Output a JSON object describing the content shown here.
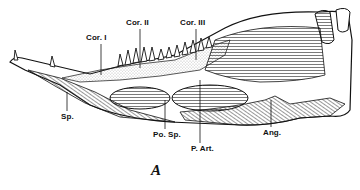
{
  "figure": {
    "caption": "A",
    "labels": [
      {
        "id": "cor1",
        "text": "Cor. I",
        "x": 86,
        "y": 34,
        "leader": [
          [
            101,
            44
          ],
          [
            101,
            75
          ]
        ]
      },
      {
        "id": "cor2",
        "text": "Cor. II",
        "x": 126,
        "y": 19,
        "leader": [
          [
            140,
            29
          ],
          [
            140,
            68
          ]
        ]
      },
      {
        "id": "cor3",
        "text": "Cor. III",
        "x": 180,
        "y": 19,
        "leader": [
          [
            196,
            29
          ],
          [
            196,
            60
          ]
        ]
      },
      {
        "id": "sp",
        "text": "Sp.",
        "x": 61,
        "y": 113,
        "leader": [
          [
            67,
            92
          ],
          [
            67,
            111
          ]
        ]
      },
      {
        "id": "posp",
        "text": "Po. Sp.",
        "x": 153,
        "y": 131,
        "leader": [
          [
            165,
            100
          ],
          [
            165,
            129
          ]
        ]
      },
      {
        "id": "part",
        "text": "P. Art.",
        "x": 191,
        "y": 145,
        "leader": [
          [
            200,
            80
          ],
          [
            200,
            143
          ]
        ]
      },
      {
        "id": "ang",
        "text": "Ang.",
        "x": 263,
        "y": 129,
        "leader": [
          [
            271,
            100
          ],
          [
            271,
            127
          ]
        ]
      }
    ],
    "colors": {
      "ink": "#111111",
      "background": "#ffffff",
      "stipple": "#9a9a9a"
    }
  }
}
